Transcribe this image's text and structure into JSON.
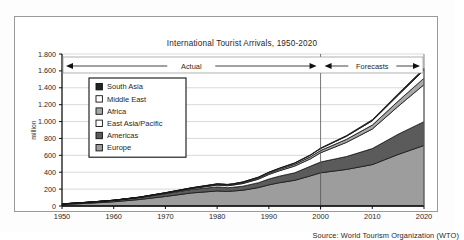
{
  "chart_data": {
    "type": "area",
    "stacked": true,
    "title": "International Tourist Arrivals, 1950-2020",
    "xlabel": "",
    "ylabel": "million",
    "xlim": [
      1950,
      2020
    ],
    "ylim": [
      0,
      1800
    ],
    "grid": true,
    "legend_position": "inside-upper-left",
    "ytick_labels": [
      "0",
      "200",
      "400",
      "600",
      "800",
      "1.000",
      "1.200",
      "1.400",
      "1.600",
      "1.800"
    ],
    "ytick_values": [
      0,
      200,
      400,
      600,
      800,
      1000,
      1200,
      1400,
      1600,
      1800
    ],
    "xtick_labels": [
      "1950",
      "1960",
      "1970",
      "1980",
      "1990",
      "2000",
      "2010",
      "2020"
    ],
    "xtick_values": [
      1950,
      1960,
      1970,
      1980,
      1990,
      2000,
      2010,
      2020
    ],
    "x": [
      1950,
      1955,
      1960,
      1965,
      1970,
      1975,
      1980,
      1981,
      1982,
      1983,
      1985,
      1988,
      1990,
      1992,
      1995,
      1998,
      2000,
      2005,
      2010,
      2015,
      2020
    ],
    "series": [
      {
        "name": "Europe",
        "color": "#9d9d9d",
        "values": [
          17,
          32,
          50,
          77,
          113,
          154,
          178,
          175,
          173,
          177,
          187,
          218,
          250,
          275,
          304,
          356,
          393,
          433,
          490,
          610,
          717
        ]
      },
      {
        "name": "Americas",
        "color": "#5b5b5b",
        "values": [
          7,
          11,
          16,
          23,
          33,
          42,
          48,
          47,
          44,
          45,
          48,
          58,
          69,
          78,
          89,
          114,
          128,
          153,
          190,
          240,
          282
        ]
      },
      {
        "name": "East Asia/Pacific",
        "color": "#ffffff",
        "values": [
          0.2,
          0.5,
          1,
          2,
          6,
          10,
          21,
          22,
          23,
          25,
          31,
          42,
          54,
          63,
          80,
          87,
          109,
          167,
          231,
          330,
          438
        ]
      },
      {
        "name": "Africa",
        "color": "#a8a8a8",
        "values": [
          0.5,
          1,
          1,
          2,
          3,
          5,
          7,
          7,
          7,
          7,
          9,
          13,
          15,
          17,
          20,
          25,
          27,
          36,
          47,
          62,
          77
        ]
      },
      {
        "name": "Middle East",
        "color": "#ffffff",
        "values": [
          0.2,
          0.4,
          0.6,
          1,
          2,
          3,
          7,
          7,
          7,
          7,
          8,
          9,
          10,
          11,
          14,
          18,
          23,
          36,
          51,
          69,
          96
        ]
      },
      {
        "name": "South Asia",
        "color": "#232323",
        "values": [
          0.2,
          0.3,
          0.5,
          1,
          1,
          2,
          2,
          2,
          2,
          2,
          3,
          3,
          3,
          4,
          4,
          5,
          6,
          9,
          13,
          19,
          19
        ]
      }
    ],
    "annotations": [
      {
        "label": "Actual",
        "from": 1950,
        "to": 2000,
        "style": "double-arrow"
      },
      {
        "label": "Forecasts",
        "from": 2000,
        "to": 2020,
        "style": "double-arrow"
      }
    ],
    "divider_year": 2000,
    "source": "Source: World Tourism Organization (WTO)"
  }
}
